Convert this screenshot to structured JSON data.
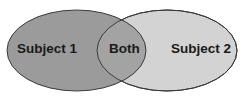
{
  "diagram": {
    "type": "venn",
    "sets": [
      {
        "id": "subject-1",
        "label": "Subject 1",
        "fill": "#9b9b9b",
        "stroke": "#3a3a3a",
        "ellipse": {
          "cx": 76.5,
          "cy": 50.5,
          "rx": 69.5,
          "ry": 40.5
        }
      },
      {
        "id": "subject-2",
        "label": "Subject 2",
        "fill": "#d3d3d3",
        "stroke": "#3a3a3a",
        "ellipse": {
          "cx": 167,
          "cy": 50.5,
          "rx": 70,
          "ry": 40.5
        }
      }
    ],
    "intersection": {
      "label": "Both",
      "fill": "#a3a3a3"
    }
  }
}
